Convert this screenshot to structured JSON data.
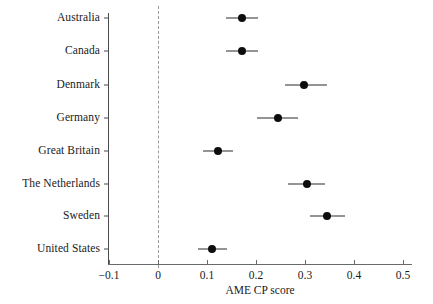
{
  "chart_data": {
    "type": "scatter",
    "chart_subtype": "forest-plot",
    "title": "",
    "xlabel": "AME CP score",
    "ylabel": "",
    "xlim": [
      -0.1,
      0.5
    ],
    "ylim": [
      0,
      8
    ],
    "grid": false,
    "legend": null,
    "reference_line": {
      "x": 0,
      "style": "dashed",
      "color": "#9a9a9a"
    },
    "xticks": [
      -0.1,
      0,
      0.1,
      0.2,
      0.3,
      0.4,
      0.5
    ],
    "xticklabels": [
      "−0.1",
      "0",
      "0.1",
      "0.2",
      "0.3",
      "0.4",
      "0.5"
    ],
    "categories": [
      "Australia",
      "Canada",
      "Denmark",
      "Germany",
      "Great Britain",
      "The Netherlands",
      "Sweden",
      "United States"
    ],
    "values": [
      0.171,
      0.171,
      0.298,
      0.245,
      0.122,
      0.304,
      0.345,
      0.11
    ],
    "ci_low": [
      0.139,
      0.139,
      0.259,
      0.202,
      0.092,
      0.266,
      0.31,
      0.082
    ],
    "ci_high": [
      0.205,
      0.205,
      0.345,
      0.286,
      0.153,
      0.341,
      0.382,
      0.141
    ],
    "points": [
      {
        "label": "Australia",
        "value": 0.171,
        "ci_low": 0.139,
        "ci_high": 0.205
      },
      {
        "label": "Canada",
        "value": 0.171,
        "ci_low": 0.139,
        "ci_high": 0.205
      },
      {
        "label": "Denmark",
        "value": 0.298,
        "ci_low": 0.259,
        "ci_high": 0.345
      },
      {
        "label": "Germany",
        "value": 0.245,
        "ci_low": 0.202,
        "ci_high": 0.286
      },
      {
        "label": "Great Britain",
        "value": 0.122,
        "ci_low": 0.092,
        "ci_high": 0.153
      },
      {
        "label": "The Netherlands",
        "value": 0.304,
        "ci_low": 0.266,
        "ci_high": 0.341
      },
      {
        "label": "Sweden",
        "value": 0.345,
        "ci_low": 0.31,
        "ci_high": 0.382
      },
      {
        "label": "United States",
        "value": 0.11,
        "ci_low": 0.082,
        "ci_high": 0.141
      }
    ],
    "colors": {
      "marker": "#0d0d0d",
      "error_bar": "#2b2b2b",
      "axis": "#6a6a6a",
      "reference_line": "#9a9a9a",
      "text": "#1a1a1a",
      "background": "#ffffff"
    }
  },
  "layout": {
    "plot_left_px": 108,
    "plot_right_px": 412,
    "x0_px": 158,
    "px_per_unit": 490,
    "axis_y_px": 264,
    "row_y_px": [
      18,
      51,
      85,
      118,
      151,
      184,
      216,
      249
    ],
    "axis_title_y_px": 285,
    "label_right_px": 100,
    "y_axis_x_px": 108
  }
}
